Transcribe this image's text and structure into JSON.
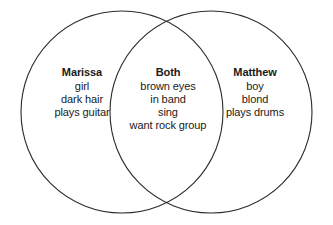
{
  "diagram": {
    "type": "venn-diagram",
    "sets": 2,
    "background_color": "#ffffff",
    "stroke_color": "#2b2b2b",
    "stroke_width": 1,
    "text_color": "#1a1a1a",
    "left_circle": {
      "cx": 122,
      "cy": 112,
      "r": 101
    },
    "right_circle": {
      "cx": 211,
      "cy": 112,
      "r": 101
    },
    "regions": [
      {
        "id": "left",
        "title": "Marissa",
        "items": [
          "girl",
          "dark hair",
          "plays guitar"
        ]
      },
      {
        "id": "center",
        "title": "Both",
        "items": [
          "brown eyes",
          "in band",
          "sing",
          "want rock group"
        ]
      },
      {
        "id": "right",
        "title": "Matthew",
        "items": [
          "boy",
          "blond",
          "plays drums"
        ]
      }
    ]
  }
}
